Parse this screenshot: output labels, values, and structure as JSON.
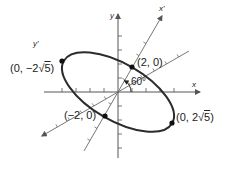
{
  "figure": {
    "colors": {
      "curve": "#2b2b2b",
      "axis": "#555555",
      "point": "#111111",
      "rotated_axis": "#666666"
    },
    "axes": {
      "x_label": "x",
      "y_label": "y",
      "x_prime_label": "x'",
      "y_prime_label": "y'"
    },
    "angle_label": "60°",
    "rotation_degrees": 60,
    "points": [
      {
        "id": "neg-y-prime-vertex",
        "prefix": "(0, −2",
        "radical": "5",
        "suffix": ")"
      },
      {
        "id": "pos-x-prime-covertex",
        "text": "(2, 0)"
      },
      {
        "id": "neg-x-prime-covertex",
        "text": "(−2, 0)"
      },
      {
        "id": "pos-y-prime-vertex",
        "prefix": "(0, 2",
        "radical": "5",
        "suffix": ")"
      }
    ],
    "ellipse": {
      "semi_major_label_axis": "y'",
      "semi_major": "2√5",
      "semi_minor": "2"
    }
  }
}
